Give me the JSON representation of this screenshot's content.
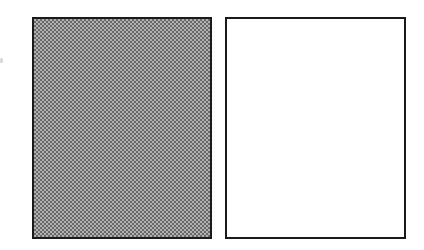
{
  "figure": {
    "panels": [
      {
        "id": "left",
        "fill": "dotted-gray",
        "pattern_dark": "#6a6a6a",
        "pattern_light": "#b0b0b0",
        "border": "#1a1a1a"
      },
      {
        "id": "right",
        "fill": "white",
        "background": "#ffffff",
        "border": "#1a1a1a"
      }
    ]
  }
}
